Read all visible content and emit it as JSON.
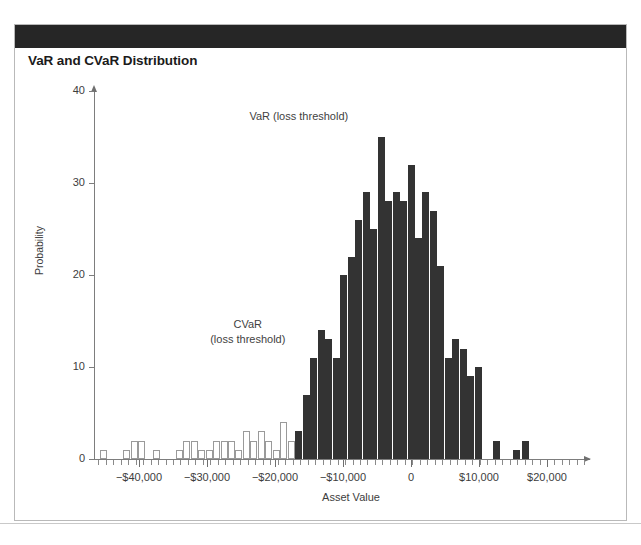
{
  "figure": {
    "title": "VaR and CVaR Distribution",
    "header_band_color": "#262626",
    "frame_border_color": "#b9b9b9"
  },
  "chart_data": {
    "type": "bar",
    "title": "VaR and CVaR Distribution",
    "xlabel": "Asset Value",
    "ylabel": "Probability",
    "xlim": [
      -46000,
      27500
    ],
    "ylim": [
      0,
      42
    ],
    "ytick_labels": [
      "0",
      "10",
      "20",
      "30",
      "40"
    ],
    "ytick_values": [
      0,
      10,
      20,
      30,
      40
    ],
    "xtick_labels": [
      "−$40,000",
      "−$30,000",
      "−$20,000",
      "−$10,000",
      "0",
      "$10,000",
      "$20,000"
    ],
    "xtick_values": [
      -40000,
      -30000,
      -20000,
      -10000,
      0,
      10000,
      20000
    ],
    "grid": false,
    "legend": "none",
    "bar_styles": {
      "tail": {
        "name": "hollow",
        "fill": "#ffffff",
        "stroke": "#9a9a9a"
      },
      "body": {
        "name": "filled",
        "fill": "#333333",
        "stroke": "#333333"
      }
    },
    "annotations": [
      {
        "name": "var-label",
        "text": "VaR (loss threshold)",
        "x": -16500,
        "y": 38
      },
      {
        "name": "cvar-label",
        "text_lines": [
          "CVaR",
          "(loss threshold)"
        ],
        "x": -24000,
        "y": 13.5
      }
    ],
    "bins": [
      {
        "x": -45200,
        "value": 1,
        "style": "hollow"
      },
      {
        "x": -43000,
        "value": 0,
        "style": "hollow"
      },
      {
        "x": -41800,
        "value": 1,
        "style": "hollow"
      },
      {
        "x": -40700,
        "value": 2,
        "style": "hollow"
      },
      {
        "x": -39600,
        "value": 2,
        "style": "hollow"
      },
      {
        "x": -38500,
        "value": 0,
        "style": "hollow"
      },
      {
        "x": -37400,
        "value": 1,
        "style": "hollow"
      },
      {
        "x": -36300,
        "value": 0,
        "style": "hollow"
      },
      {
        "x": -35200,
        "value": 0,
        "style": "hollow"
      },
      {
        "x": -34100,
        "value": 1,
        "style": "hollow"
      },
      {
        "x": -33000,
        "value": 2,
        "style": "hollow"
      },
      {
        "x": -31900,
        "value": 2,
        "style": "hollow"
      },
      {
        "x": -30800,
        "value": 1,
        "style": "hollow"
      },
      {
        "x": -29700,
        "value": 1,
        "style": "hollow"
      },
      {
        "x": -28600,
        "value": 2,
        "style": "hollow"
      },
      {
        "x": -27500,
        "value": 2,
        "style": "hollow"
      },
      {
        "x": -26400,
        "value": 2,
        "style": "hollow"
      },
      {
        "x": -25300,
        "value": 1,
        "style": "hollow"
      },
      {
        "x": -24200,
        "value": 3,
        "style": "hollow"
      },
      {
        "x": -23100,
        "value": 2,
        "style": "hollow"
      },
      {
        "x": -22000,
        "value": 3,
        "style": "hollow"
      },
      {
        "x": -20900,
        "value": 2,
        "style": "hollow"
      },
      {
        "x": -19800,
        "value": 1,
        "style": "hollow"
      },
      {
        "x": -18700,
        "value": 4,
        "style": "hollow"
      },
      {
        "x": -17600,
        "value": 2,
        "style": "hollow"
      },
      {
        "x": -16500,
        "value": 3,
        "style": "filled"
      },
      {
        "x": -15400,
        "value": 7,
        "style": "filled"
      },
      {
        "x": -14300,
        "value": 11,
        "style": "filled"
      },
      {
        "x": -13200,
        "value": 14,
        "style": "filled"
      },
      {
        "x": -12100,
        "value": 13,
        "style": "filled"
      },
      {
        "x": -11000,
        "value": 11,
        "style": "filled"
      },
      {
        "x": -9900,
        "value": 20,
        "style": "filled"
      },
      {
        "x": -8800,
        "value": 22,
        "style": "filled"
      },
      {
        "x": -7700,
        "value": 26,
        "style": "filled"
      },
      {
        "x": -6600,
        "value": 29,
        "style": "filled"
      },
      {
        "x": -5500,
        "value": 25,
        "style": "filled"
      },
      {
        "x": -4400,
        "value": 35,
        "style": "filled"
      },
      {
        "x": -3300,
        "value": 28,
        "style": "filled"
      },
      {
        "x": -2200,
        "value": 29,
        "style": "filled"
      },
      {
        "x": -1100,
        "value": 28,
        "style": "filled"
      },
      {
        "x": 0,
        "value": 32,
        "style": "filled"
      },
      {
        "x": 1100,
        "value": 24,
        "style": "filled"
      },
      {
        "x": 2200,
        "value": 29,
        "style": "filled"
      },
      {
        "x": 3300,
        "value": 27,
        "style": "filled"
      },
      {
        "x": 4400,
        "value": 21,
        "style": "filled"
      },
      {
        "x": 5500,
        "value": 11,
        "style": "filled"
      },
      {
        "x": 6600,
        "value": 13,
        "style": "filled"
      },
      {
        "x": 7700,
        "value": 12,
        "style": "filled"
      },
      {
        "x": 8800,
        "value": 9,
        "style": "filled"
      },
      {
        "x": 9900,
        "value": 10,
        "style": "filled"
      },
      {
        "x": 12500,
        "value": 2,
        "style": "filled"
      },
      {
        "x": 15500,
        "value": 1,
        "style": "filled"
      },
      {
        "x": 16800,
        "value": 2,
        "style": "filled"
      }
    ]
  }
}
